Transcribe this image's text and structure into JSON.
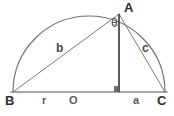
{
  "diagram": {
    "type": "geometry-semicircle-right-triangle",
    "canvas": {
      "width": 174,
      "height": 116
    },
    "colors": {
      "baseline": "#8a8a8a",
      "arc": "#6e6e6e",
      "chord": "#7a7a7a",
      "altitude": "#4a4a4a",
      "text": "#3a3a3a",
      "background": "#ffffff"
    },
    "points": {
      "B": {
        "label": "B",
        "x": 13,
        "y": 92,
        "label_x": 7,
        "label_y": 95
      },
      "C": {
        "label": "C",
        "x": 165,
        "y": 92,
        "label_x": 159,
        "label_y": 95
      },
      "O": {
        "label": "O",
        "x": 89,
        "y": 92,
        "label_x": 70,
        "label_y": 95
      },
      "A": {
        "label": "A",
        "x": 119,
        "y": 14,
        "label_x": 126,
        "label_y": 2
      },
      "D": {
        "label": "",
        "x": 119,
        "y": 92
      }
    },
    "segments": {
      "b": {
        "label": "b",
        "from": "B",
        "to": "A",
        "label_x": 57,
        "label_y": 43
      },
      "c": {
        "label": "c",
        "from": "A",
        "to": "C",
        "label_x": 142,
        "label_y": 43
      },
      "r": {
        "label": "r",
        "from": "B",
        "to": "O",
        "label_x": 42,
        "label_y": 95
      },
      "a": {
        "label": "a",
        "from": "D",
        "to": "C",
        "label_x": 134,
        "label_y": 95
      },
      "altitude": {
        "label": "",
        "from": "A",
        "to": "D"
      }
    },
    "angle": {
      "label": "θ",
      "vertex": "A",
      "between": [
        "altitude",
        "b"
      ],
      "label_x": 112,
      "label_y": 23
    },
    "markers": {
      "right_angle_at_foot": {
        "name": "right-angle-square",
        "x": 116,
        "y": 87,
        "size": 5
      }
    },
    "arc": {
      "center_x": 89,
      "center_y": 92,
      "radius": 76,
      "start_angle_deg": 180,
      "end_angle_deg": 0
    }
  }
}
